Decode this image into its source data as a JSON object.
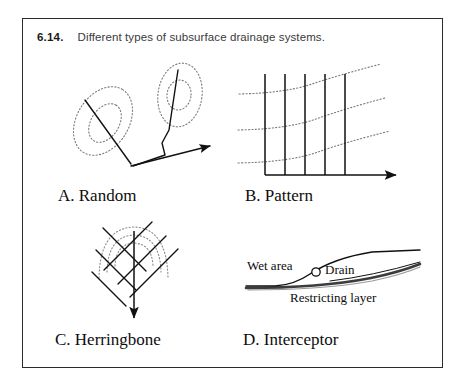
{
  "figure": {
    "number": "6.14.",
    "caption": "Different types of subsurface drainage systems.",
    "frame_border_color": "#2b2b2b",
    "background_color": "#ffffff"
  },
  "style": {
    "drain_line_color": "#111111",
    "contour_line_color": "#7a7a7a",
    "restricting_layer_color": "#1a1a1a",
    "surface_line_color": "#111111"
  },
  "panels": [
    {
      "id": "a",
      "label": "A. Random",
      "description": "Random drainage system: isolated wet depressions shown as dotted closed contours, each drained by an individual lateral joining a main outlet line with a flow arrow.",
      "elements": {
        "depressions": 2,
        "contours_per_depression": 2,
        "laterals": 2,
        "outlet_arrows": 1
      }
    },
    {
      "id": "b",
      "label": "B. Pattern",
      "description": "Pattern (parallel) drainage system: evenly spaced parallel laterals discharging into a horizontal main with a flow arrow, crossing dotted ground-surface contour lines.",
      "elements": {
        "laterals": 5,
        "contours": 3,
        "main_lines": 1,
        "outlet_arrows": 1
      }
    },
    {
      "id": "c",
      "label": "C. Herringbone",
      "description": "Herringbone drainage system: a central main running down a draw with angled laterals entering from both sides, over nested dotted contour arcs, terminating in a downward flow arrow.",
      "elements": {
        "main_lines": 1,
        "lateral_pairs": 4,
        "contours": 3,
        "outlet_arrows": 1
      }
    },
    {
      "id": "d",
      "label": "D. Interceptor",
      "description": "Interceptor drainage system: a single drain placed on a slope above a restricting layer to intercept lateral seepage and dry the wet area below.",
      "annotations": {
        "wet_area": "Wet area",
        "drain": "Drain",
        "restricting_layer": "Restricting layer"
      },
      "elements": {
        "surface_curves": 2,
        "drain_markers": 1,
        "restricting_layers": 1
      }
    }
  ]
}
